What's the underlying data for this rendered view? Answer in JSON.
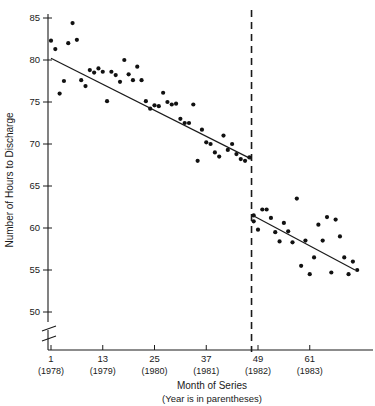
{
  "chart_data": {
    "type": "scatter",
    "title": "",
    "xlabel": "Month of Series",
    "xlabel_sub": "(Year is in parentheses)",
    "ylabel": "Number of Hours to Discharge",
    "xlim": [
      1,
      72
    ],
    "ylim": [
      48.5,
      86.5
    ],
    "y_axis_break": true,
    "y_break_below": 50,
    "grid": false,
    "legend": false,
    "yticks": [
      50,
      55,
      60,
      65,
      70,
      75,
      80,
      85
    ],
    "ytick_labels": [
      "50",
      "55",
      "60",
      "65",
      "70",
      "75",
      "80",
      "85"
    ],
    "xticks": [
      1,
      13,
      25,
      37,
      49,
      61
    ],
    "xtick_labels": [
      "1",
      "13",
      "25",
      "37",
      "49",
      "61"
    ],
    "xtick_sublabels": [
      "(1978)",
      "(1979)",
      "(1980)",
      "(1981)",
      "(1982)",
      "(1983)"
    ],
    "intervention": {
      "label": "intervention-line",
      "x": 47.5,
      "style": "dashed"
    },
    "series": [
      {
        "name": "pre-intervention",
        "x": [
          1,
          2,
          3,
          4,
          5,
          6,
          7,
          8,
          9,
          10,
          11,
          12,
          13,
          14,
          15,
          16,
          17,
          18,
          19,
          20,
          21,
          22,
          23,
          24,
          25,
          26,
          27,
          28,
          29,
          30,
          31,
          32,
          33,
          34,
          35,
          36,
          37,
          38,
          39,
          40,
          41,
          42,
          43,
          44,
          45,
          46,
          47
        ],
        "y": [
          82.3,
          81.3,
          76.0,
          77.5,
          82.0,
          84.4,
          82.4,
          77.6,
          76.9,
          78.8,
          78.5,
          79.0,
          78.6,
          75.1,
          78.6,
          78.2,
          77.4,
          80.0,
          78.3,
          77.6,
          79.2,
          77.6,
          75.1,
          74.2,
          74.6,
          74.5,
          76.1,
          75.0,
          74.7,
          74.8,
          73.0,
          72.5,
          72.5,
          74.7,
          68.0,
          71.7,
          70.2,
          70.0,
          69.0,
          68.5,
          71.0,
          69.3,
          70.0,
          68.8,
          68.2,
          68.0,
          68.4
        ]
      },
      {
        "name": "post-intervention",
        "x": [
          48,
          48,
          49,
          50,
          51,
          52,
          53,
          54,
          55,
          56,
          57,
          58,
          59,
          60,
          61,
          62,
          63,
          64,
          65,
          66,
          67,
          68,
          69,
          70,
          71,
          72
        ],
        "y": [
          61.5,
          60.8,
          59.8,
          62.2,
          62.2,
          61.2,
          59.5,
          58.4,
          60.6,
          59.6,
          58.3,
          63.5,
          55.5,
          58.5,
          54.5,
          56.5,
          60.4,
          58.5,
          61.3,
          54.7,
          61.0,
          59.0,
          56.5,
          54.5,
          56.0,
          55.0
        ]
      }
    ],
    "fit_lines": [
      {
        "name": "pre-intervention-fit",
        "x0": 1,
        "y0": 80.2,
        "x1": 47.5,
        "y1": 68.2
      },
      {
        "name": "post-intervention-fit",
        "x0": 47.8,
        "y0": 61.5,
        "x1": 71.5,
        "y1": 55.0
      }
    ]
  }
}
